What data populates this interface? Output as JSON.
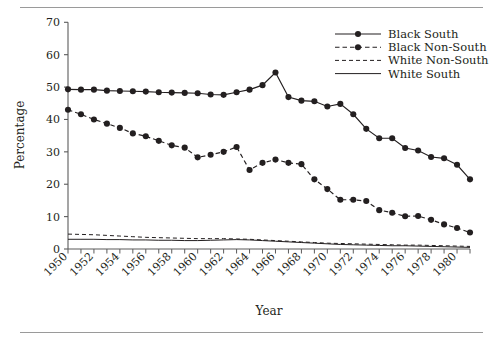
{
  "figure": {
    "top_rule": "",
    "bottom_rule": ""
  },
  "chart_data": {
    "type": "line",
    "title": "",
    "xlabel": "Year",
    "ylabel": "Percentage",
    "xlim": [
      1950,
      1981
    ],
    "ylim": [
      0,
      70
    ],
    "ytick_step": 10,
    "xtick_step": 1,
    "xtick_label_step": 2,
    "grid": false,
    "legend_position": "upper right",
    "ytick_labels": [
      "0",
      "10",
      "20",
      "30",
      "40",
      "50",
      "60",
      "70"
    ],
    "ytick_values": [
      0,
      10,
      20,
      30,
      40,
      50,
      60,
      70
    ],
    "xtick_labels": [
      "1950",
      "1952",
      "1954",
      "1956",
      "1958",
      "1960",
      "1962",
      "1964",
      "1966",
      "1968",
      "1970",
      "1972",
      "1974",
      "1976",
      "1978",
      "1980"
    ],
    "xtick_label_values": [
      1950,
      1952,
      1954,
      1956,
      1958,
      1960,
      1962,
      1964,
      1966,
      1968,
      1970,
      1972,
      1974,
      1976,
      1978,
      1980
    ],
    "x": [
      1950,
      1951,
      1952,
      1953,
      1954,
      1955,
      1956,
      1957,
      1958,
      1959,
      1960,
      1961,
      1962,
      1963,
      1964,
      1965,
      1966,
      1967,
      1968,
      1969,
      1970,
      1971,
      1972,
      1973,
      1974,
      1975,
      1976,
      1977,
      1978,
      1979,
      1980,
      1981
    ],
    "series": [
      {
        "name": "Black South",
        "style": "solid",
        "marker": "circle",
        "color": "#231f20",
        "values": [
          49.3,
          49.2,
          49.2,
          48.9,
          48.8,
          48.7,
          48.6,
          48.4,
          48.3,
          48.2,
          48.1,
          47.7,
          47.6,
          48.4,
          49.2,
          50.6,
          54.5,
          46.9,
          45.8,
          45.6,
          44.0,
          44.8,
          41.6,
          37.1,
          34.2,
          34.2,
          31.2,
          30.4,
          28.4,
          28.0,
          26.0,
          21.5
        ]
      },
      {
        "name": "Black Non-South",
        "style": "dashed",
        "marker": "circle",
        "color": "#231f20",
        "values": [
          43.0,
          41.6,
          40.0,
          38.7,
          37.4,
          35.7,
          34.8,
          33.4,
          32.0,
          31.3,
          28.3,
          29.1,
          30.0,
          31.5,
          24.4,
          26.6,
          27.6,
          26.6,
          26.2,
          21.5,
          18.5,
          15.2,
          15.2,
          14.8,
          12.0,
          11.2,
          10.1,
          10.2,
          9.0,
          7.6,
          6.5,
          5.1
        ]
      },
      {
        "name": "White Non-South",
        "style": "dashed",
        "marker": "none",
        "color": "#231f20",
        "values": [
          4.6,
          4.5,
          4.4,
          4.2,
          4.0,
          3.8,
          3.6,
          3.5,
          3.4,
          3.3,
          3.2,
          3.2,
          3.2,
          3.1,
          3.0,
          2.8,
          2.6,
          2.4,
          2.2,
          2.0,
          1.8,
          1.7,
          1.6,
          1.5,
          1.4,
          1.3,
          1.2,
          1.2,
          1.1,
          1.0,
          0.9,
          0.8
        ]
      },
      {
        "name": "White South",
        "style": "solid",
        "marker": "none",
        "color": "#231f20",
        "values": [
          3.0,
          3.0,
          3.0,
          2.9,
          2.9,
          2.8,
          2.8,
          2.7,
          2.7,
          2.6,
          2.6,
          2.7,
          2.8,
          2.9,
          2.8,
          2.6,
          2.4,
          2.2,
          2.0,
          1.8,
          1.6,
          1.4,
          1.3,
          1.2,
          1.1,
          1.0,
          1.0,
          0.9,
          0.8,
          0.7,
          0.6,
          0.5
        ]
      }
    ]
  }
}
